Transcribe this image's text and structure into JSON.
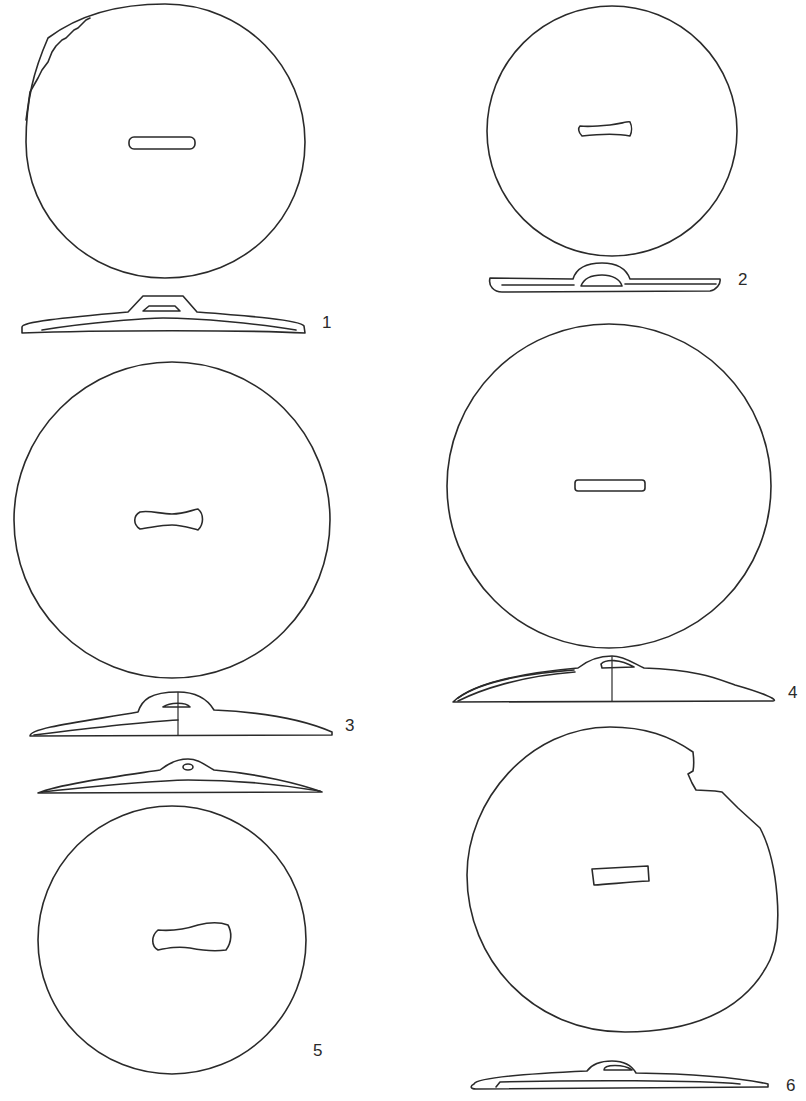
{
  "plate": {
    "description": "Line drawings of six disc-shaped objects, each shown in plan view with a central slot and in side profile with a raised loop/handle",
    "stroke_color": "#2a2a2a",
    "background_color": "#ffffff"
  },
  "figures": [
    {
      "number": "1",
      "slot_shape": "rounded rectangle",
      "edge": "partially jagged top-left",
      "profile": "trapezoidal loop"
    },
    {
      "number": "2",
      "slot_shape": "waisted bar",
      "edge": "complete",
      "profile": "semicircular loop"
    },
    {
      "number": "3",
      "slot_shape": "waisted (bone-shaped)",
      "edge": "complete",
      "profile": "half-section with center line"
    },
    {
      "number": "4",
      "slot_shape": "narrow rectangle",
      "edge": "complete",
      "profile": "half-section with center line"
    },
    {
      "number": "5",
      "slot_shape": "waisted (bone-shaped)",
      "edge": "complete",
      "profile": "low loop with small perforation"
    },
    {
      "number": "6",
      "slot_shape": "trapezoidal rectangle",
      "edge": "broken upper-right",
      "profile": "low loop"
    }
  ]
}
